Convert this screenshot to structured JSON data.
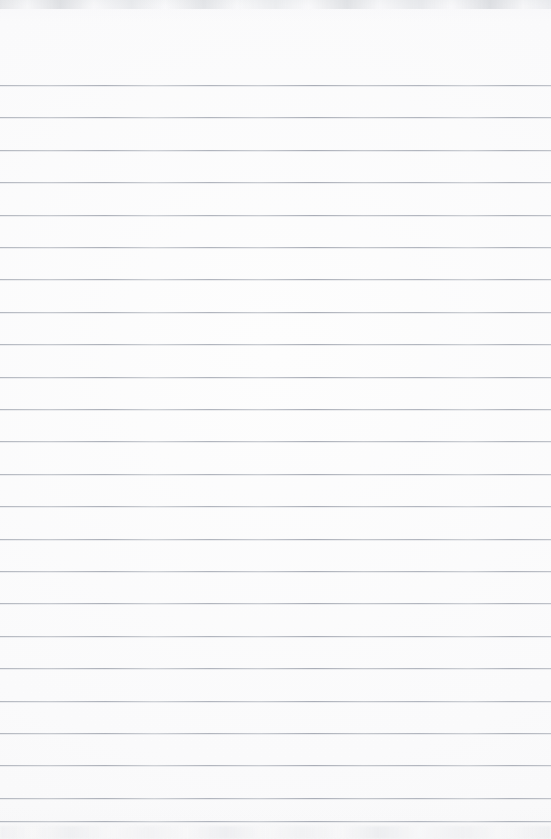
{
  "document": {
    "kind": "lined-paper-scan",
    "title": "Blank Ruled Notebook Page",
    "page_width": 551,
    "page_height": 839,
    "orientation": "portrait",
    "has_text_content": false,
    "has_margin_rule": false,
    "has_holes": false,
    "body_text": ""
  },
  "colors": {
    "paper": "#fdfdfd",
    "rule_line": "#b8bcc4",
    "rule_line_light": "#cdd0d5",
    "rule_line_dark": "#a9adb7",
    "scan_edge_smudge": "#d6d8db",
    "page_background": "#ffffff"
  },
  "ruling": {
    "style": "wide-ruled",
    "line_count": 24,
    "first_line_y": 85,
    "line_spacing": 32.4,
    "line_thickness": 1,
    "left_inset": 0,
    "right_inset": 0,
    "top_margin": 85,
    "line_positions": [
      85,
      117.4,
      149.8,
      182.2,
      214.6,
      247.0,
      279.4,
      311.8,
      344.2,
      376.6,
      409.0,
      441.4,
      473.8,
      506.2,
      538.6,
      571.0,
      603.4,
      635.8,
      668.2,
      700.6,
      733.0,
      765.4,
      797.8,
      821.0
    ]
  },
  "annotations": {
    "scan_edge_top_label": "scan edge smudge band",
    "scan_edge_bottom_label": "scan edge smudge band"
  }
}
